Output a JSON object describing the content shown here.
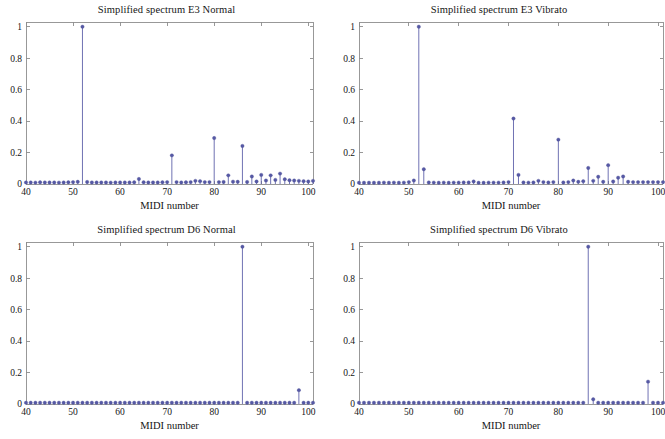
{
  "figure": {
    "background_color": "#ffffff",
    "stem_color": "#5659a5",
    "axis_color": "#8d8d8d",
    "panel_count": 4
  },
  "axis_common": {
    "xlabel": "MIDI number",
    "ylabel": "",
    "xticks": [
      40,
      50,
      60,
      70,
      80,
      90,
      100
    ],
    "xtick_labels": [
      "40",
      "50",
      "60",
      "70",
      "80",
      "90",
      "100"
    ],
    "yticks": [
      0,
      0.2,
      0.4,
      0.6,
      0.8,
      1
    ],
    "ytick_labels": [
      "0",
      "0.2",
      "0.4",
      "0.6",
      "0.8",
      "1"
    ],
    "xlim": [
      40,
      101
    ],
    "ylim": [
      0,
      1.03
    ],
    "grid": false,
    "legend": "none"
  },
  "chart_data": [
    {
      "type": "line",
      "plot_style": "stem",
      "panel": "top-left",
      "title": "Simplified spectrum E3 Normal",
      "xlabel": "MIDI number",
      "ylabel": "",
      "xlim": [
        40,
        101
      ],
      "ylim": [
        0,
        1.03
      ],
      "grid": false,
      "x": [
        40,
        41,
        42,
        43,
        44,
        45,
        46,
        47,
        48,
        49,
        50,
        51,
        52,
        53,
        54,
        55,
        56,
        57,
        58,
        59,
        60,
        61,
        62,
        63,
        64,
        65,
        66,
        67,
        68,
        69,
        70,
        71,
        72,
        73,
        74,
        75,
        76,
        77,
        78,
        79,
        80,
        81,
        82,
        83,
        84,
        85,
        86,
        87,
        88,
        89,
        90,
        91,
        92,
        93,
        94,
        95,
        96,
        97,
        98,
        99,
        100,
        101
      ],
      "values": [
        0.01,
        0.01,
        0.009,
        0.011,
        0.01,
        0.01,
        0.01,
        0.009,
        0.01,
        0.011,
        0.012,
        0.014,
        1.0,
        0.013,
        0.01,
        0.01,
        0.01,
        0.01,
        0.009,
        0.01,
        0.01,
        0.01,
        0.01,
        0.011,
        0.032,
        0.011,
        0.01,
        0.01,
        0.01,
        0.011,
        0.012,
        0.182,
        0.012,
        0.01,
        0.011,
        0.012,
        0.02,
        0.018,
        0.012,
        0.012,
        0.292,
        0.012,
        0.013,
        0.055,
        0.015,
        0.014,
        0.242,
        0.013,
        0.048,
        0.016,
        0.058,
        0.022,
        0.055,
        0.026,
        0.066,
        0.03,
        0.024,
        0.022,
        0.02,
        0.018,
        0.016,
        0.02
      ]
    },
    {
      "type": "line",
      "plot_style": "stem",
      "panel": "top-right",
      "title": "Simplified spectrum E3 Vibrato",
      "xlabel": "MIDI number",
      "ylabel": "",
      "xlim": [
        40,
        101
      ],
      "ylim": [
        0,
        1.03
      ],
      "grid": false,
      "x": [
        40,
        41,
        42,
        43,
        44,
        45,
        46,
        47,
        48,
        49,
        50,
        51,
        52,
        53,
        54,
        55,
        56,
        57,
        58,
        59,
        60,
        61,
        62,
        63,
        64,
        65,
        66,
        67,
        68,
        69,
        70,
        71,
        72,
        73,
        74,
        75,
        76,
        77,
        78,
        79,
        80,
        81,
        82,
        83,
        84,
        85,
        86,
        87,
        88,
        89,
        90,
        91,
        92,
        93,
        94,
        95,
        96,
        97,
        98,
        99,
        100,
        101
      ],
      "values": [
        0.008,
        0.008,
        0.008,
        0.008,
        0.008,
        0.009,
        0.008,
        0.009,
        0.008,
        0.009,
        0.012,
        0.022,
        1.0,
        0.094,
        0.01,
        0.009,
        0.008,
        0.009,
        0.008,
        0.009,
        0.009,
        0.01,
        0.01,
        0.016,
        0.008,
        0.008,
        0.009,
        0.009,
        0.009,
        0.01,
        0.012,
        0.416,
        0.058,
        0.01,
        0.009,
        0.01,
        0.02,
        0.012,
        0.01,
        0.012,
        0.282,
        0.01,
        0.012,
        0.022,
        0.014,
        0.018,
        0.102,
        0.02,
        0.046,
        0.014,
        0.12,
        0.016,
        0.04,
        0.048,
        0.014,
        0.012,
        0.012,
        0.012,
        0.012,
        0.012,
        0.012,
        0.012
      ]
    },
    {
      "type": "line",
      "plot_style": "stem",
      "panel": "bottom-left",
      "title": "Simplified spectrum D6 Normal",
      "xlabel": "MIDI number",
      "ylabel": "",
      "xlim": [
        40,
        101
      ],
      "ylim": [
        0,
        1.03
      ],
      "grid": false,
      "x": [
        40,
        41,
        42,
        43,
        44,
        45,
        46,
        47,
        48,
        49,
        50,
        51,
        52,
        53,
        54,
        55,
        56,
        57,
        58,
        59,
        60,
        61,
        62,
        63,
        64,
        65,
        66,
        67,
        68,
        69,
        70,
        71,
        72,
        73,
        74,
        75,
        76,
        77,
        78,
        79,
        80,
        81,
        82,
        83,
        84,
        85,
        86,
        87,
        88,
        89,
        90,
        91,
        92,
        93,
        94,
        95,
        96,
        97,
        98,
        99,
        100,
        101
      ],
      "values": [
        0.008,
        0.008,
        0.008,
        0.008,
        0.008,
        0.008,
        0.008,
        0.008,
        0.008,
        0.008,
        0.008,
        0.008,
        0.008,
        0.008,
        0.008,
        0.008,
        0.008,
        0.008,
        0.008,
        0.008,
        0.008,
        0.008,
        0.008,
        0.008,
        0.008,
        0.008,
        0.008,
        0.008,
        0.008,
        0.008,
        0.008,
        0.008,
        0.008,
        0.008,
        0.008,
        0.008,
        0.008,
        0.008,
        0.008,
        0.008,
        0.008,
        0.008,
        0.008,
        0.008,
        0.008,
        0.008,
        1.0,
        0.008,
        0.008,
        0.008,
        0.008,
        0.008,
        0.008,
        0.008,
        0.008,
        0.008,
        0.008,
        0.008,
        0.088,
        0.008,
        0.008,
        0.008
      ]
    },
    {
      "type": "line",
      "plot_style": "stem",
      "panel": "bottom-right",
      "title": "Simplified spectrum D6 Vibrato",
      "xlabel": "MIDI number",
      "ylabel": "",
      "xlim": [
        40,
        101
      ],
      "ylim": [
        0,
        1.03
      ],
      "grid": false,
      "x": [
        40,
        41,
        42,
        43,
        44,
        45,
        46,
        47,
        48,
        49,
        50,
        51,
        52,
        53,
        54,
        55,
        56,
        57,
        58,
        59,
        60,
        61,
        62,
        63,
        64,
        65,
        66,
        67,
        68,
        69,
        70,
        71,
        72,
        73,
        74,
        75,
        76,
        77,
        78,
        79,
        80,
        81,
        82,
        83,
        84,
        85,
        86,
        87,
        88,
        89,
        90,
        91,
        92,
        93,
        94,
        95,
        96,
        97,
        98,
        99,
        100,
        101
      ],
      "values": [
        0.008,
        0.008,
        0.008,
        0.008,
        0.008,
        0.008,
        0.008,
        0.008,
        0.008,
        0.008,
        0.008,
        0.008,
        0.008,
        0.008,
        0.008,
        0.008,
        0.008,
        0.008,
        0.008,
        0.008,
        0.008,
        0.008,
        0.008,
        0.008,
        0.008,
        0.008,
        0.008,
        0.008,
        0.008,
        0.008,
        0.008,
        0.008,
        0.008,
        0.008,
        0.008,
        0.008,
        0.008,
        0.008,
        0.008,
        0.008,
        0.008,
        0.008,
        0.008,
        0.008,
        0.008,
        0.008,
        1.0,
        0.03,
        0.008,
        0.008,
        0.008,
        0.008,
        0.008,
        0.008,
        0.008,
        0.008,
        0.008,
        0.008,
        0.142,
        0.008,
        0.008,
        0.008
      ]
    }
  ]
}
